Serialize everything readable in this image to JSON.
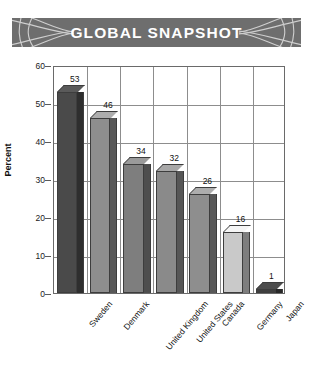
{
  "banner": {
    "title": "GLOBAL SNAPSHOT",
    "background_color": "#6e6e6e",
    "text_color": "#ffffff",
    "ornament_left": "flourish-ornament",
    "ornament_right": "flourish-ornament"
  },
  "chart_data": {
    "type": "bar",
    "title": "GLOBAL SNAPSHOT",
    "xlabel": "",
    "ylabel": "Percent",
    "ylim": [
      0,
      60
    ],
    "yticks": [
      0,
      10,
      20,
      30,
      40,
      50,
      60
    ],
    "grid": true,
    "legend": "none",
    "three_d": true,
    "categories": [
      "Sweden",
      "Denmark",
      "United Kingdom",
      "United States",
      "Canada",
      "Germany",
      "Japan"
    ],
    "values": [
      53,
      46,
      34,
      32,
      26,
      16,
      1
    ],
    "value_labels": [
      "53",
      "46",
      "34",
      "32",
      "26",
      "16",
      "1"
    ],
    "bar_colors": [
      "#4a4a4a",
      "#8e8e8e",
      "#7e7e7e",
      "#8a8a8a",
      "#8e8e8e",
      "#c9c9c9",
      "#3f3f3f"
    ]
  }
}
